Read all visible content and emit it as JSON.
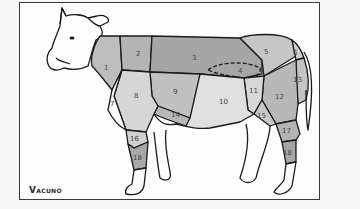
{
  "diagram": {
    "title": "Vacuno",
    "colors": {
      "dark": "#a9a9a9",
      "medium": "#c2c2c2",
      "light": "#dcdcdc",
      "white": "#fdfdfd",
      "outline": "#1a1a1a"
    },
    "cuts": [
      {
        "id": "1",
        "label": "1"
      },
      {
        "id": "2",
        "label": "2"
      },
      {
        "id": "3",
        "label": "3"
      },
      {
        "id": "4",
        "label": "4"
      },
      {
        "id": "5",
        "label": "5"
      },
      {
        "id": "6",
        "label": "6"
      },
      {
        "id": "7",
        "label": "7"
      },
      {
        "id": "8",
        "label": "8"
      },
      {
        "id": "9",
        "label": "9"
      },
      {
        "id": "10",
        "label": "10"
      },
      {
        "id": "11",
        "label": "11"
      },
      {
        "id": "12",
        "label": "12"
      },
      {
        "id": "13",
        "label": "13"
      },
      {
        "id": "14",
        "label": "14"
      },
      {
        "id": "15",
        "label": "15"
      },
      {
        "id": "16",
        "label": "16"
      },
      {
        "id": "17",
        "label": "17"
      },
      {
        "id": "18a",
        "label": "18"
      },
      {
        "id": "18b",
        "label": "18"
      }
    ]
  }
}
